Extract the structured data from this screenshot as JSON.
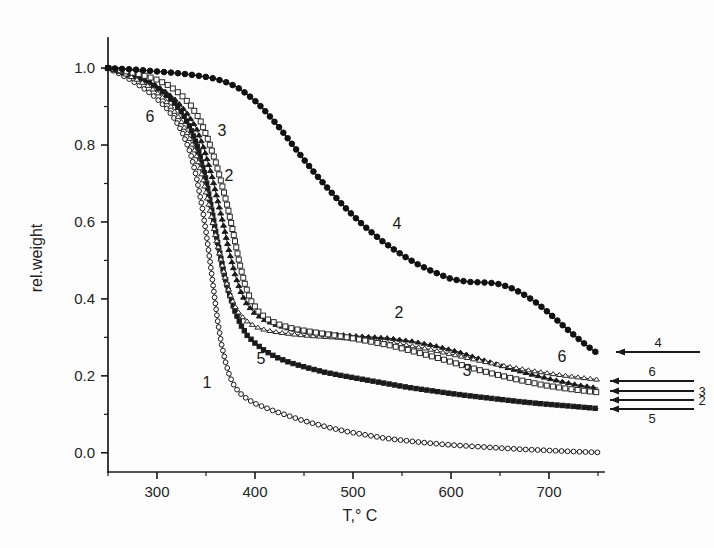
{
  "figure": {
    "background": "#fdfdfd",
    "ink_color": "#1a1a1a"
  },
  "chart_data": {
    "type": "line",
    "title": "",
    "subtitle": "",
    "xlabel": "T,° C",
    "ylabel": "rel.weight",
    "xlim": [
      250,
      750
    ],
    "ylim": [
      -0.05,
      1.06
    ],
    "grid": false,
    "legend_position": "right-outside-arrows",
    "x_ticks": [
      300,
      400,
      500,
      600,
      700
    ],
    "x_tick_labels": [
      "300",
      "400",
      "500",
      "600",
      "700"
    ],
    "x_minor_ticks": [
      250,
      350,
      450,
      550,
      650,
      750
    ],
    "y_ticks": [
      0.0,
      0.2,
      0.4,
      0.6,
      0.8,
      1.0
    ],
    "y_tick_labels": [
      "0.0",
      "0.2",
      "0.4",
      "0.6",
      "0.8",
      "1.0"
    ],
    "y_minor_ticks": [
      0.1,
      0.3,
      0.5,
      0.7,
      0.9,
      1.1
    ],
    "series": [
      {
        "name": "1",
        "label": "1",
        "marker": "open-circle",
        "color": "#1a1a1a",
        "fill": "#ffffff",
        "marker_size": 4.6,
        "line_width": 1.0,
        "x": [
          250,
          262,
          274,
          286,
          298,
          310,
          318,
          326,
          334,
          340,
          346,
          350,
          354,
          358,
          362,
          366,
          370,
          374,
          378,
          382,
          386,
          392,
          400,
          410,
          420,
          432,
          446,
          460,
          478,
          496,
          514,
          532,
          552,
          574,
          596,
          620,
          646,
          672,
          700,
          726,
          750
        ],
        "y": [
          1.0,
          0.985,
          0.968,
          0.948,
          0.925,
          0.895,
          0.868,
          0.832,
          0.78,
          0.72,
          0.64,
          0.575,
          0.5,
          0.42,
          0.34,
          0.28,
          0.235,
          0.2,
          0.178,
          0.163,
          0.152,
          0.14,
          0.128,
          0.118,
          0.108,
          0.098,
          0.086,
          0.076,
          0.064,
          0.054,
          0.046,
          0.038,
          0.032,
          0.026,
          0.021,
          0.017,
          0.013,
          0.009,
          0.006,
          0.003,
          0.001
        ]
      },
      {
        "name": "5",
        "label": "5",
        "marker": "filled-square",
        "color": "#1a1a1a",
        "fill": "#1a1a1a",
        "marker_size": 4.2,
        "line_width": 1.0,
        "x": [
          250,
          264,
          278,
          292,
          304,
          316,
          326,
          334,
          342,
          350,
          356,
          362,
          368,
          374,
          380,
          386,
          392,
          400,
          410,
          422,
          436,
          452,
          470,
          490,
          512,
          534,
          556,
          578,
          600,
          622,
          646,
          670,
          694,
          718,
          750
        ],
        "y": [
          1.0,
          0.99,
          0.978,
          0.962,
          0.942,
          0.915,
          0.882,
          0.845,
          0.79,
          0.71,
          0.63,
          0.545,
          0.47,
          0.41,
          0.365,
          0.33,
          0.305,
          0.285,
          0.265,
          0.248,
          0.234,
          0.222,
          0.21,
          0.2,
          0.19,
          0.18,
          0.17,
          0.162,
          0.154,
          0.147,
          0.14,
          0.133,
          0.127,
          0.122,
          0.115
        ]
      },
      {
        "name": "2",
        "label": "2",
        "marker": "filled-triangle",
        "color": "#1a1a1a",
        "fill": "#1a1a1a",
        "marker_size": 4.8,
        "line_width": 1.0,
        "x": [
          250,
          266,
          282,
          296,
          308,
          320,
          330,
          340,
          348,
          356,
          362,
          368,
          374,
          380,
          386,
          392,
          400,
          410,
          422,
          436,
          452,
          470,
          490,
          512,
          536,
          560,
          584,
          608,
          632,
          656,
          680,
          704,
          728,
          750
        ],
        "y": [
          1.0,
          0.99,
          0.977,
          0.96,
          0.94,
          0.915,
          0.885,
          0.845,
          0.79,
          0.72,
          0.655,
          0.59,
          0.52,
          0.46,
          0.415,
          0.385,
          0.362,
          0.345,
          0.332,
          0.322,
          0.315,
          0.31,
          0.306,
          0.302,
          0.298,
          0.29,
          0.278,
          0.262,
          0.242,
          0.222,
          0.205,
          0.19,
          0.177,
          0.168
        ]
      },
      {
        "name": "6",
        "label": "6",
        "marker": "open-triangle",
        "color": "#2a2a2a",
        "fill": "#ffffff",
        "marker_size": 4.8,
        "line_width": 1.0,
        "x": [
          250,
          264,
          278,
          292,
          304,
          314,
          324,
          332,
          340,
          346,
          352,
          358,
          364,
          370,
          376,
          382,
          390,
          400,
          412,
          426,
          442,
          460,
          480,
          502,
          526,
          550,
          576,
          602,
          628,
          654,
          680,
          706,
          730,
          750
        ],
        "y": [
          1.0,
          0.988,
          0.972,
          0.952,
          0.928,
          0.9,
          0.865,
          0.825,
          0.775,
          0.72,
          0.655,
          0.585,
          0.515,
          0.45,
          0.4,
          0.368,
          0.345,
          0.328,
          0.318,
          0.312,
          0.307,
          0.303,
          0.3,
          0.296,
          0.29,
          0.282,
          0.27,
          0.255,
          0.24,
          0.226,
          0.214,
          0.204,
          0.196,
          0.19
        ]
      },
      {
        "name": "3",
        "label": "3",
        "marker": "open-square",
        "color": "#2a2a2a",
        "fill": "#ffffff",
        "marker_size": 4.8,
        "line_width": 1.0,
        "x": [
          250,
          266,
          282,
          298,
          312,
          324,
          334,
          344,
          352,
          360,
          366,
          372,
          378,
          384,
          390,
          396,
          404,
          414,
          426,
          440,
          456,
          474,
          494,
          516,
          540,
          564,
          590,
          616,
          642,
          668,
          694,
          720,
          750
        ],
        "y": [
          1.0,
          0.993,
          0.984,
          0.972,
          0.955,
          0.932,
          0.905,
          0.865,
          0.815,
          0.755,
          0.7,
          0.64,
          0.57,
          0.495,
          0.435,
          0.395,
          0.365,
          0.345,
          0.332,
          0.322,
          0.315,
          0.308,
          0.3,
          0.29,
          0.278,
          0.262,
          0.244,
          0.224,
          0.206,
          0.19,
          0.176,
          0.166,
          0.157
        ]
      },
      {
        "name": "4",
        "label": "4",
        "marker": "filled-circle",
        "color": "#111111",
        "fill": "#111111",
        "marker_size": 5.4,
        "line_width": 1.2,
        "x": [
          250,
          264,
          278,
          292,
          306,
          320,
          334,
          348,
          360,
          372,
          382,
          392,
          400,
          408,
          416,
          424,
          432,
          440,
          450,
          460,
          470,
          482,
          494,
          506,
          518,
          530,
          542,
          554,
          566,
          578,
          590,
          600,
          610,
          620,
          630,
          640,
          650,
          660,
          672,
          684,
          696,
          708,
          720,
          732,
          744,
          750
        ],
        "y": [
          1.0,
          0.998,
          0.996,
          0.993,
          0.99,
          0.987,
          0.983,
          0.978,
          0.972,
          0.962,
          0.95,
          0.932,
          0.915,
          0.895,
          0.872,
          0.848,
          0.822,
          0.795,
          0.762,
          0.73,
          0.7,
          0.665,
          0.632,
          0.602,
          0.575,
          0.55,
          0.528,
          0.508,
          0.49,
          0.475,
          0.462,
          0.452,
          0.447,
          0.444,
          0.443,
          0.442,
          0.438,
          0.43,
          0.415,
          0.396,
          0.372,
          0.345,
          0.318,
          0.292,
          0.268,
          0.258
        ]
      }
    ],
    "inline_annotations": [
      {
        "text": "6",
        "x": 150,
        "y": 122
      },
      {
        "text": "3",
        "x": 222,
        "y": 136
      },
      {
        "text": "2",
        "x": 229,
        "y": 181
      },
      {
        "text": "4",
        "x": 397,
        "y": 229
      },
      {
        "text": "5",
        "x": 261,
        "y": 364
      },
      {
        "text": "1",
        "x": 207,
        "y": 388
      },
      {
        "text": "2",
        "x": 399,
        "y": 318
      },
      {
        "text": "3",
        "x": 467,
        "y": 376
      },
      {
        "text": "6",
        "x": 562,
        "y": 362
      }
    ],
    "side_legend": {
      "arrows": [
        {
          "label": "4",
          "label_side": "above",
          "y": 352,
          "x1": 616,
          "x2": 700
        },
        {
          "label": "6",
          "label_side": "above",
          "y": 381,
          "x1": 610,
          "x2": 694
        },
        {
          "label": "3",
          "label_side": "right",
          "y": 391,
          "x1": 610,
          "x2": 694
        },
        {
          "label": "2",
          "label_side": "right",
          "y": 400,
          "x1": 610,
          "x2": 694
        },
        {
          "label": "5",
          "label_side": "below",
          "y": 409,
          "x1": 610,
          "x2": 694
        }
      ]
    }
  }
}
